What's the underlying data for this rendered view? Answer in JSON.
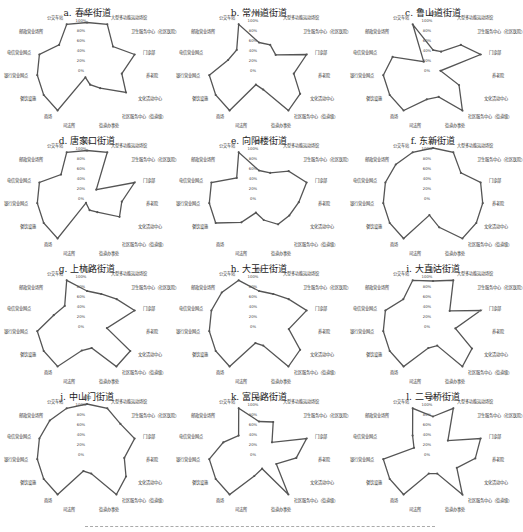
{
  "chart_data": {
    "type": "radar",
    "axes": [
      "初中",
      "大型多功能运动场馆",
      "卫生服务中心（社区医院）",
      "门诊部",
      "养老院",
      "文化活动中心",
      "社区服务中心（街道级）",
      "街道办事处",
      "司法所",
      "商场",
      "餐饮设施",
      "银行营业网点",
      "电信营业网点",
      "邮政营业场所",
      "公交车站"
    ],
    "radial_ticks": [
      "0%",
      "20%",
      "40%",
      "60%",
      "80%",
      "100%"
    ],
    "rlim": [
      0,
      100
    ],
    "grid": false,
    "line_color": "#555555",
    "panels": [
      {
        "title": "a. 春华街道",
        "values": [
          95,
          100,
          70,
          100,
          70,
          90,
          45,
          30,
          15,
          100,
          100,
          100,
          100,
          75,
          100
        ]
      },
      {
        "title": "b. 常州道街道",
        "values": [
          55,
          55,
          45,
          100,
          70,
          95,
          100,
          40,
          30,
          100,
          100,
          100,
          65,
          60,
          100
        ]
      },
      {
        "title": "c. 鲁山道街道",
        "values": [
          40,
          40,
          75,
          100,
          15,
          60,
          100,
          55,
          60,
          100,
          100,
          100,
          85,
          25,
          100
        ]
      },
      {
        "title": "d. 唐家口街道",
        "values": [
          95,
          100,
          25,
          100,
          70,
          75,
          35,
          25,
          10,
          100,
          100,
          100,
          100,
          70,
          100
        ]
      },
      {
        "title": "e. 向阳楼街道",
        "values": [
          55,
          55,
          80,
          100,
          80,
          70,
          65,
          45,
          30,
          60,
          100,
          100,
          100,
          60,
          100
        ]
      },
      {
        "title": "f. 东新街道",
        "values": [
          100,
          100,
          75,
          100,
          100,
          100,
          100,
          60,
          35,
          100,
          100,
          100,
          100,
          100,
          100
        ]
      },
      {
        "title": "g. 上杭路街道",
        "values": [
          70,
          70,
          80,
          100,
          40,
          100,
          100,
          45,
          50,
          100,
          100,
          100,
          70,
          60,
          100
        ]
      },
      {
        "title": "h. 大王庄街道",
        "values": [
          70,
          70,
          80,
          100,
          60,
          95,
          100,
          40,
          35,
          100,
          100,
          100,
          100,
          100,
          100
        ]
      },
      {
        "title": "i. 大直沽街道",
        "values": [
          90,
          100,
          45,
          100,
          45,
          90,
          100,
          40,
          45,
          100,
          100,
          100,
          100,
          80,
          100
        ]
      },
      {
        "title": "j. 中山门街道",
        "values": [
          100,
          100,
          90,
          100,
          75,
          90,
          100,
          40,
          35,
          100,
          100,
          100,
          100,
          100,
          100
        ]
      },
      {
        "title": "k. 富民路街道",
        "values": [
          65,
          70,
          35,
          100,
          75,
          40,
          100,
          30,
          45,
          100,
          100,
          100,
          75,
          55,
          100
        ]
      },
      {
        "title": "l. 二号桥街道",
        "values": [
          75,
          100,
          40,
          100,
          85,
          55,
          100,
          40,
          40,
          100,
          100,
          100,
          40,
          55,
          100
        ]
      }
    ]
  }
}
